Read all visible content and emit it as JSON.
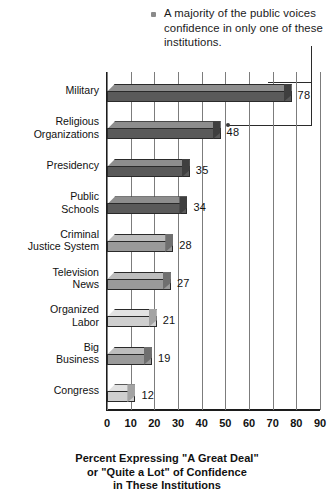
{
  "annotation": {
    "bullet_icon": "square-bullet",
    "text": "A majority of the public voices confidence in only one of these institutions."
  },
  "chart_data": {
    "type": "bar",
    "orientation": "horizontal",
    "title": "",
    "xlabel": "Percent Expressing \"A Great Deal\" or \"Quite a Lot\" of Confidence in These Institutions",
    "ylabel": "",
    "xlim": [
      0,
      90
    ],
    "xticks": [
      "0",
      "10",
      "20",
      "30",
      "40",
      "50",
      "60",
      "70",
      "80",
      "90"
    ],
    "grid": true,
    "legend": "none",
    "categories": [
      "Military",
      "Religious Organizations",
      "Presidency",
      "Public Schools",
      "Criminal Justice System",
      "Television News",
      "Organized Labor",
      "Big Business",
      "Congress"
    ],
    "values": [
      78,
      48,
      35,
      34,
      28,
      27,
      21,
      19,
      12
    ],
    "annotations": [
      "A majority of the public voices confidence in only one of these institutions."
    ]
  },
  "axis_title": {
    "line1": "Percent Expressing \"A Great Deal\"",
    "line2": "or \"Quite a Lot\" of Confidence",
    "line3": "in These Institutions"
  },
  "categories_display": [
    {
      "line1": "Military",
      "line2": ""
    },
    {
      "line1": "Religious",
      "line2": "Organizations"
    },
    {
      "line1": "Presidency",
      "line2": ""
    },
    {
      "line1": "Public",
      "line2": "Schools"
    },
    {
      "line1": "Criminal",
      "line2": "Justice System"
    },
    {
      "line1": "Television",
      "line2": "News"
    },
    {
      "line1": "Organized",
      "line2": "Labor"
    },
    {
      "line1": "Big",
      "line2": "Business"
    },
    {
      "line1": "Congress",
      "line2": ""
    }
  ],
  "value_labels": [
    "78",
    "48",
    "35",
    "34",
    "28",
    "27",
    "21",
    "19",
    "12"
  ],
  "colors": {
    "bar_dark_front": "#5a5a5a",
    "bar_dark_top": "#8d8d8d",
    "bar_dark_cap": "#3f3f3f",
    "bar_mid_front": "#9a9a9a",
    "bar_mid_top": "#bdbdbd",
    "bar_mid_cap": "#6f6f6f",
    "bar_light_front": "#cfcfcf",
    "bar_light_top": "#e2e2e2",
    "bar_light_cap": "#a3a3a3",
    "grid": "#7c7c7c",
    "axis": "#1c1c1c",
    "text": "#111111",
    "bullet": "#8a8a8a"
  }
}
